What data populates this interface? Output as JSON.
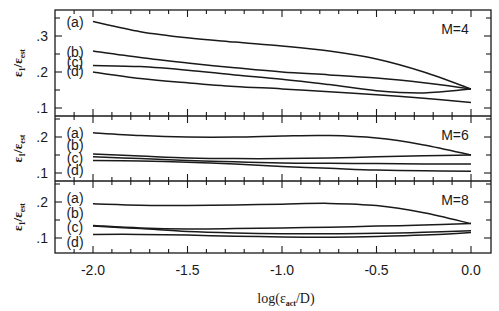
{
  "chart_data": {
    "type": "line",
    "layout": "3 vertically stacked panels sharing x-axis",
    "xlabel": "log(ε_act/D)",
    "xlabel_parts": {
      "base": "log(ε",
      "sub": "act",
      "tail": "/D)"
    },
    "ylabel": "ε_1/ε_est",
    "ylabel_parts": {
      "base1": "ε",
      "sub1": "1",
      "slash": "/",
      "base2": "ε",
      "sub2": "est"
    },
    "xlim": [
      -2.2,
      0.05
    ],
    "x_ticks": [
      -2.0,
      -1.5,
      -1.0,
      -0.5,
      0.0
    ],
    "x_tick_labels": [
      "-2.0",
      "-1.5",
      "-1.0",
      "-0.5",
      "0.0"
    ],
    "grid": false,
    "x": [
      -2.0,
      -1.75,
      -1.5,
      -1.25,
      -1.0,
      -0.75,
      -0.5,
      -0.25,
      0.0
    ],
    "panels": [
      {
        "title": "M=4",
        "ylim": [
          0.075,
          0.37
        ],
        "y_ticks": [
          0.1,
          0.2,
          0.3
        ],
        "y_tick_labels": [
          ".1",
          ".2",
          ".3"
        ],
        "series": [
          {
            "name": "(a)",
            "values": [
              0.34,
              0.312,
              0.295,
              0.283,
              0.272,
              0.258,
              0.236,
              0.2,
              0.153
            ]
          },
          {
            "name": "(b)",
            "values": [
              0.258,
              0.24,
              0.225,
              0.212,
              0.2,
              0.192,
              0.183,
              0.17,
              0.153
            ]
          },
          {
            "name": "(c)",
            "values": [
              0.218,
              0.215,
              0.205,
              0.192,
              0.18,
              0.165,
              0.148,
              0.142,
              0.153
            ]
          },
          {
            "name": "(d)",
            "values": [
              0.2,
              0.182,
              0.17,
              0.16,
              0.153,
              0.145,
              0.137,
              0.127,
              0.115
            ]
          }
        ]
      },
      {
        "title": "M=6",
        "ylim": [
          0.075,
          0.26
        ],
        "y_ticks": [
          0.1,
          0.2
        ],
        "y_tick_labels": [
          ".1",
          ".2"
        ],
        "series": [
          {
            "name": "(a)",
            "values": [
              0.212,
              0.204,
              0.2,
              0.2,
              0.203,
              0.204,
              0.197,
              0.178,
              0.15
            ]
          },
          {
            "name": "(b)",
            "values": [
              0.153,
              0.147,
              0.142,
              0.14,
              0.14,
              0.142,
              0.145,
              0.148,
              0.15
            ]
          },
          {
            "name": "(c)",
            "values": [
              0.145,
              0.14,
              0.135,
              0.131,
              0.128,
              0.127,
              0.126,
              0.125,
              0.125
            ]
          },
          {
            "name": "(d)",
            "values": [
              0.135,
              0.133,
              0.13,
              0.125,
              0.118,
              0.113,
              0.108,
              0.106,
              0.105
            ]
          }
        ]
      },
      {
        "title": "M=8",
        "ylim": [
          0.065,
          0.23
        ],
        "y_ticks": [
          0.1,
          0.2
        ],
        "y_tick_labels": [
          ".1",
          ".2"
        ],
        "series": [
          {
            "name": "(a)",
            "values": [
              0.195,
              0.191,
              0.19,
              0.192,
              0.194,
              0.196,
              0.19,
              0.17,
              0.14
            ]
          },
          {
            "name": "(b)",
            "values": [
              0.135,
              0.128,
              0.125,
              0.126,
              0.128,
              0.13,
              0.133,
              0.136,
              0.14
            ]
          },
          {
            "name": "(c)",
            "values": [
              0.133,
              0.126,
              0.118,
              0.114,
              0.112,
              0.112,
              0.113,
              0.116,
              0.12
            ]
          },
          {
            "name": "(d)",
            "values": [
              0.11,
              0.11,
              0.108,
              0.105,
              0.103,
              0.102,
              0.104,
              0.108,
              0.115
            ]
          }
        ]
      }
    ]
  }
}
